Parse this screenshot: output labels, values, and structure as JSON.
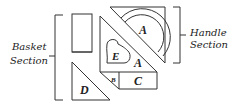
{
  "diagram": {
    "sections": {
      "basket": {
        "line1": "Basket",
        "line2": "Section"
      },
      "handle": {
        "line1": "Handle",
        "line2": "Section"
      }
    },
    "pieces": {
      "A_handle": "A",
      "A_panel": "A",
      "B": "B",
      "C": "C",
      "D": "D",
      "E": "E"
    },
    "colors": {
      "stroke": "#333333",
      "text": "#222222",
      "background": "#ffffff"
    }
  }
}
